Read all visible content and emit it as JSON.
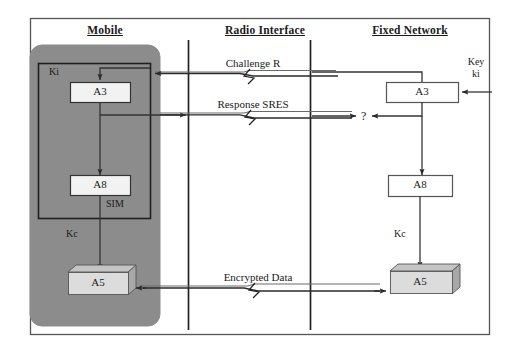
{
  "diagram": {
    "columns": [
      {
        "id": "mobile",
        "label": "Mobile"
      },
      {
        "id": "radio-interface",
        "label": "Radio Interface"
      },
      {
        "id": "fixed-network",
        "label": "Fixed Network"
      }
    ],
    "mobile": {
      "sim_label": "SIM",
      "key_label": "Ki",
      "cipher_key_label": "Kc",
      "blocks": [
        {
          "id": "a3",
          "label": "A3"
        },
        {
          "id": "a8",
          "label": "A8"
        },
        {
          "id": "a5",
          "label": "A5"
        }
      ]
    },
    "network": {
      "key_label_line1": "Key",
      "key_label_line2": "ki",
      "cipher_key_label": "Kc",
      "compare_symbol": "?",
      "blocks": [
        {
          "id": "a3",
          "label": "A3"
        },
        {
          "id": "a8",
          "label": "A8"
        },
        {
          "id": "a5",
          "label": "A5"
        }
      ]
    },
    "messages": [
      {
        "id": "challenge",
        "label": "Challenge R",
        "direction": "network-to-mobile"
      },
      {
        "id": "response",
        "label": "Response SRES",
        "direction": "mobile-to-network"
      },
      {
        "id": "encrypted",
        "label": "Encrypted Data",
        "direction": "bidirectional"
      }
    ],
    "colors": {
      "mobile_fill": "#8c8c8c",
      "block_fill": "#f2f2f2",
      "a5_fill": "#d9d9d9",
      "a5_shade": "#a8a8a8",
      "stroke": "#3a3a3a",
      "border": "#555555",
      "text": "#1a1a1a"
    }
  }
}
